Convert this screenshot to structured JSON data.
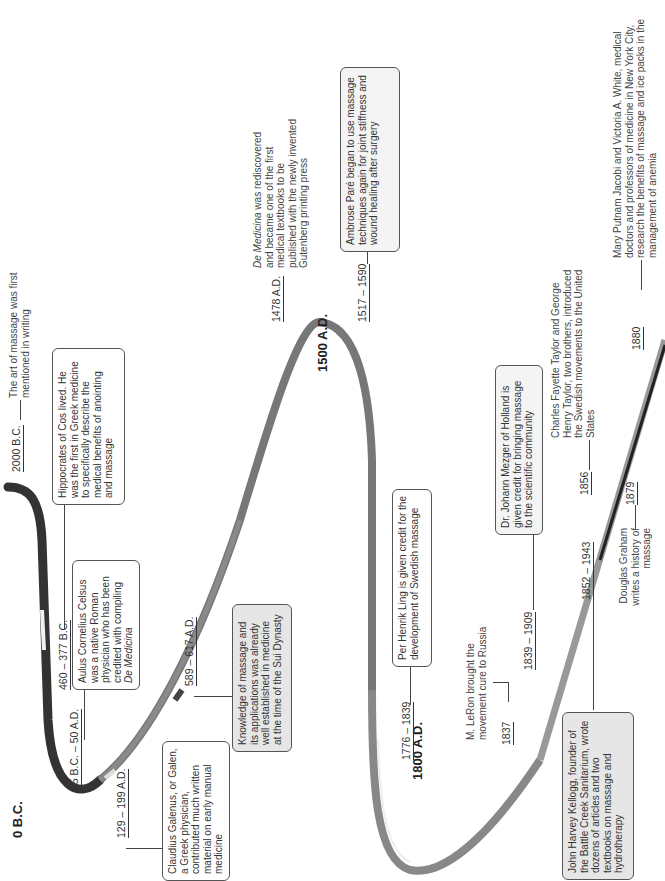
{
  "colors": {
    "curve_dark": "#3a3a3a",
    "curve_mid": "#6e6e6e",
    "curve_light": "#9a9a9a",
    "box_grey": "#e6e6e6",
    "text": "#333333"
  },
  "eras": {
    "bc0": "0 B.C.",
    "ad1500": "1500 A.D.",
    "ad1800": "1800 A.D."
  },
  "events": {
    "e2000bc": {
      "date": "2000 B.C.",
      "text": "The art of massage was first mentioned in writing"
    },
    "e460bc": {
      "date": "460 – 377 B.C.",
      "text": "Hippocrates of Cos lived. He was the first in Greek medicine to specifically describe the medical benefits of anointing and massage"
    },
    "e25bc": {
      "date": "25 B.C. – 50 A.D.",
      "text_a": "Aulus Cornelius Celsus was a native Roman physician who has been credited with compiling ",
      "text_b": "De Medicina"
    },
    "e129ad": {
      "date": "129 – 199 A.D.",
      "text": "Claudius Galenus, or Galen, a Greek physician, contributed much written material on early manual medicine"
    },
    "e589ad": {
      "date": "589 – 617 A.D.",
      "text": "Knowledge of massage and its applications was already well established in medicine at the time of the Sui Dynasty"
    },
    "e1478ad": {
      "date": "1478 A.D.",
      "text_a": "De Medicina",
      "text_b": " was rediscovered and became one of the first medical textbooks to be published with the newly invented Gutenberg printing press"
    },
    "e1517": {
      "date": "1517 – 1590",
      "text": "Ambrose Paré began to use massage techniques again for joint stiffness and wound healing after surgery"
    },
    "e1776": {
      "date": "1776 – 1839",
      "text": "Per Henrik Ling is given credit for the development of Swedish massage"
    },
    "e1837": {
      "date": "1837",
      "text": "M. LeRon brought the movement cure to Russia"
    },
    "e1839": {
      "date": "1839 – 1909",
      "text": "Dr. Johann Mezger of Holland is given credit for bringing massage to the scientific community"
    },
    "e1852": {
      "date": "1852 – 1943",
      "text": "John Harvey Kellogg, founder of the Battle Creek Sanitarium, wrote dozens of articles and two textbooks on massage and hydrotherapy"
    },
    "e1856": {
      "date": "1856",
      "text": "Charles Fayette Taylor and George Henry Taylor, two brothers, introduced the Swedish movements to the United States"
    },
    "e1879": {
      "date": "1879",
      "text": "Douglas Graham writes a history of massage"
    },
    "e1880": {
      "date": "1880",
      "text": "Mary Putnam Jacobi and Victoria A. White, medical doctors and professors of medicine in New York City, research the benefits of massage and ice packs in the management of anemia"
    }
  }
}
